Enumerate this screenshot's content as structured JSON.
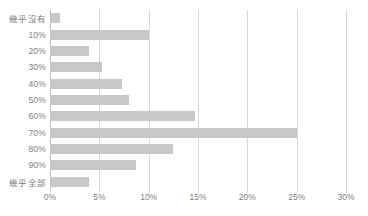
{
  "chart_data": {
    "type": "bar",
    "orientation": "horizontal",
    "title": "",
    "subtitle": "",
    "xlabel": "",
    "ylabel": "",
    "categories": [
      "幾乎沒有",
      "10%",
      "20%",
      "30%",
      "40%",
      "50%",
      "60%",
      "70%",
      "80%",
      "90%",
      "幾乎全部"
    ],
    "values": [
      1.0,
      10.0,
      4.0,
      5.3,
      7.3,
      8.0,
      14.7,
      25.0,
      12.5,
      8.7,
      4.0
    ],
    "value_unit": "%",
    "xlim": [
      0,
      30
    ],
    "xticks": [
      0,
      5,
      10,
      15,
      20,
      25,
      30
    ],
    "xtick_labels": [
      "0%",
      "5%",
      "10%",
      "15%",
      "20%",
      "25%",
      "30%"
    ],
    "grid": "vertical",
    "legend": "none",
    "annotations": []
  },
  "style": {
    "bar_color": "#c8c8c8",
    "gridline_color": "#d9d9d9",
    "axis_color": "#bfbfbf",
    "label_color": "#808080",
    "background": "#ffffff"
  }
}
